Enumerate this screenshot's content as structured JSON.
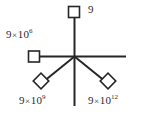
{
  "diagram": {
    "type": "radial-star-diagram",
    "background_color": "#ffffff",
    "stroke_color": "#262626",
    "text_color": "#2b2b2b",
    "center": {
      "x": 74,
      "y": 56
    },
    "arms": [
      {
        "name": "arm-up",
        "direction": "up",
        "endpoint": {
          "x": 74,
          "y": 12
        },
        "marker": "square",
        "marker_name": "square-marker-top",
        "label_id": "label-top"
      },
      {
        "name": "arm-left",
        "direction": "left",
        "endpoint": {
          "x": 33,
          "y": 56
        },
        "marker": "square",
        "marker_name": "square-marker-left",
        "label_id": "label-left"
      },
      {
        "name": "arm-down-left",
        "direction": "down-left",
        "endpoint": {
          "x": 43,
          "y": 84
        },
        "marker": "diamond",
        "marker_name": "diamond-marker-bottom-left",
        "label_id": "label-bottom-left"
      },
      {
        "name": "arm-down-right",
        "direction": "down-right",
        "endpoint": {
          "x": 107,
          "y": 84
        },
        "marker": "diamond",
        "marker_name": "diamond-marker-bottom-right",
        "label_id": "label-bottom-right"
      },
      {
        "name": "arm-right",
        "direction": "right",
        "endpoint": {
          "x": 126,
          "y": 56
        },
        "marker": "none",
        "marker_name": "",
        "label_id": ""
      },
      {
        "name": "arm-down",
        "direction": "down",
        "endpoint": {
          "x": 74,
          "y": 106
        },
        "marker": "none",
        "marker_name": "",
        "label_id": ""
      }
    ],
    "labels": {
      "top": {
        "mantissa": "9",
        "has_power": false,
        "multiply": "",
        "base": "",
        "exponent": "",
        "full_text": "9"
      },
      "left": {
        "mantissa": "9",
        "has_power": true,
        "multiply": "×",
        "base": "10",
        "exponent": "6",
        "full_text": "9×10⁶"
      },
      "bottom_left": {
        "mantissa": "9",
        "has_power": true,
        "multiply": "×",
        "base": "10",
        "exponent": "9",
        "full_text": "9×10⁹"
      },
      "bottom_right": {
        "mantissa": "9",
        "has_power": true,
        "multiply": "×",
        "base": "10",
        "exponent": "12",
        "full_text": "9×10¹²"
      }
    }
  }
}
